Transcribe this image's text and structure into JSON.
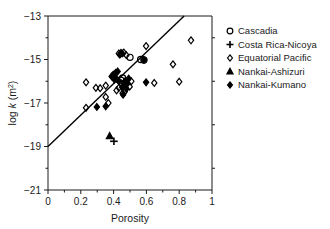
{
  "chart_data": {
    "type": "scatter",
    "title": "",
    "xlabel": "Porosity",
    "ylabel": "log k (m2)",
    "ylabel_prefix": "log ",
    "ylabel_italic": "k",
    "ylabel_unit": " (m",
    "ylabel_exp": "2",
    "ylabel_close": ")",
    "xlim": [
      0,
      1
    ],
    "ylim": [
      -21,
      -13
    ],
    "xticks": [
      "0",
      "0.2",
      "0.4",
      "0.6",
      "0.8",
      "1"
    ],
    "xtick_values": [
      0,
      0.2,
      0.4,
      0.6,
      0.8,
      1
    ],
    "yticks": [
      "-13",
      "-15",
      "-17",
      "-19",
      "-21"
    ],
    "ytick_values": [
      -13,
      -15,
      -17,
      -19,
      -21
    ],
    "minor_xticks": [
      0.1,
      0.3,
      0.5,
      0.7,
      0.9
    ],
    "minor_yticks": [
      -14,
      -16,
      -18,
      -20
    ],
    "grid": false,
    "legend_position": "right-outside",
    "trendline": {
      "label": "regression",
      "x0": 0.0,
      "y0": -19.0,
      "x1": 0.83,
      "y1": -13.0,
      "slope": 7.23,
      "intercept": -19.0
    },
    "series": [
      {
        "name": "Cascadia",
        "marker": "circle-open",
        "points": [
          [
            0.5,
            -14.9
          ],
          [
            0.565,
            -15.0
          ],
          [
            0.585,
            -15.02
          ],
          [
            0.455,
            -15.85
          ],
          [
            0.445,
            -15.95
          ]
        ]
      },
      {
        "name": "Costa Rica-Nicoya",
        "marker": "plus",
        "points": [
          [
            0.402,
            -18.76
          ]
        ]
      },
      {
        "name": "Equatorial Pacific",
        "marker": "diamond-open",
        "points": [
          [
            0.232,
            -16.05
          ],
          [
            0.232,
            -17.22
          ],
          [
            0.292,
            -16.3
          ],
          [
            0.318,
            -16.32
          ],
          [
            0.352,
            -16.2
          ],
          [
            0.368,
            -17.0
          ],
          [
            0.352,
            -16.72
          ],
          [
            0.418,
            -16.42
          ],
          [
            0.432,
            -16.3
          ],
          [
            0.448,
            -16.1
          ],
          [
            0.455,
            -16.55
          ],
          [
            0.468,
            -16.48
          ],
          [
            0.468,
            -16.12
          ],
          [
            0.498,
            -16.25
          ],
          [
            0.508,
            -16.0
          ],
          [
            0.598,
            -14.38
          ],
          [
            0.648,
            -16.08
          ],
          [
            0.762,
            -15.22
          ],
          [
            0.8,
            -16.02
          ],
          [
            0.872,
            -14.12
          ],
          [
            0.432,
            -14.72
          ],
          [
            0.462,
            -14.68
          ],
          [
            0.478,
            -14.8
          ]
        ]
      },
      {
        "name": "Nankai-Ashizuri",
        "marker": "triangle-filled",
        "points": [
          [
            0.376,
            -18.52
          ]
        ]
      },
      {
        "name": "Nankai-Kumano",
        "marker": "diamond-filled",
        "points": [
          [
            0.298,
            -17.18
          ],
          [
            0.352,
            -17.15
          ],
          [
            0.388,
            -15.78
          ],
          [
            0.398,
            -15.7
          ],
          [
            0.405,
            -15.92
          ],
          [
            0.412,
            -15.62
          ],
          [
            0.418,
            -15.88
          ],
          [
            0.425,
            -15.55
          ],
          [
            0.432,
            -16.0
          ],
          [
            0.438,
            -14.78
          ],
          [
            0.445,
            -14.7
          ],
          [
            0.452,
            -14.72
          ],
          [
            0.452,
            -16.28
          ],
          [
            0.458,
            -16.62
          ],
          [
            0.465,
            -16.08
          ],
          [
            0.472,
            -15.98
          ],
          [
            0.478,
            -16.35
          ],
          [
            0.485,
            -16.1
          ],
          [
            0.492,
            -15.88
          ],
          [
            0.585,
            -15.02
          ],
          [
            0.598,
            -16.05
          ]
        ]
      }
    ]
  },
  "legend": {
    "entries": [
      {
        "label": "Cascadia",
        "marker": "circle-open"
      },
      {
        "label": "Costa Rica-Nicoya",
        "marker": "plus"
      },
      {
        "label": "Equatorial Pacific",
        "marker": "diamond-open"
      },
      {
        "label": "Nankai-Ashizuri",
        "marker": "triangle-filled"
      },
      {
        "label": "Nankai-Kumano",
        "marker": "diamond-filled"
      }
    ]
  },
  "colors": {
    "ink": "#1a1a1a",
    "marker": "#000000",
    "background": "#ffffff"
  }
}
